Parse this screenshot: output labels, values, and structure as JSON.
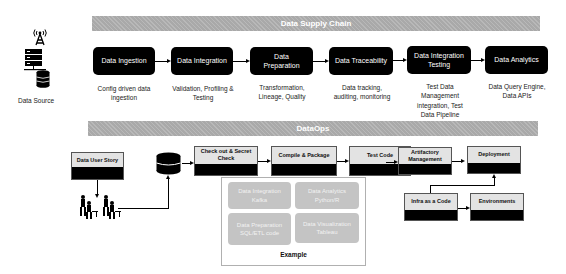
{
  "data_source": {
    "label": "Data Source",
    "icons": [
      "antenna-tower-icon",
      "server-rack-icon",
      "database-icon"
    ]
  },
  "supply_chain": {
    "title": "Data Supply Chain",
    "stages": [
      {
        "label": "Data Ingestion",
        "desc": "Config driven data ingestion"
      },
      {
        "label": "Data Integration",
        "desc": "Validation, Profiling & Testing"
      },
      {
        "label": "Data Preparation",
        "desc": "Transformation, Lineage, Quality"
      },
      {
        "label": "Data Traceability",
        "desc": "Data tracking, auditing, monitoring"
      },
      {
        "label": "Data Integration Testing",
        "desc": "Test Data Management integration, Test Data Pipeline"
      },
      {
        "label": "Data Analytics",
        "desc": "Data Query Engine, Data APIs"
      }
    ]
  },
  "dataops": {
    "title": "DataOps",
    "user_story": "Data User Story",
    "steps": [
      {
        "label": "Check out & Secret Check"
      },
      {
        "label": "Compile & Package"
      },
      {
        "label": "Test Code"
      },
      {
        "label": "Artifactory Management"
      },
      {
        "label": "Deployment"
      }
    ],
    "infra": {
      "label": "Infra as a Code"
    },
    "environments": {
      "label": "Environments"
    },
    "example": {
      "title": "Example",
      "items": [
        {
          "label": "Data Integration Kafka"
        },
        {
          "label": "Data Analytics Python/R"
        },
        {
          "label": "Data Preparation SQL/ETL code"
        },
        {
          "label": "Data Visualization Tableau"
        }
      ]
    }
  },
  "colors": {
    "band": "#a9a9a9",
    "stage_bg": "#000000",
    "ops_label_bg": "#e3e3e3",
    "example_item_bg": "#c4c4c4"
  }
}
